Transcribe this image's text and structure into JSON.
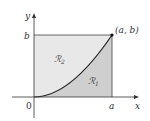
{
  "diagram": {
    "axes": {
      "x_label": "x",
      "y_label": "y",
      "origin_label": "0"
    },
    "tick_labels": {
      "a": "a",
      "b": "b"
    },
    "point": {
      "label": "(a, b)"
    },
    "regions": [
      {
        "name": "R1",
        "symbol": "ℛ",
        "subscript": "1",
        "color": "#cfcfcf"
      },
      {
        "name": "R2",
        "symbol": "ℛ",
        "subscript": "2",
        "color": "#e8e8e8"
      }
    ],
    "colors": {
      "axis": "#333333",
      "curve": "#222222",
      "rect_border": "#555555"
    }
  }
}
